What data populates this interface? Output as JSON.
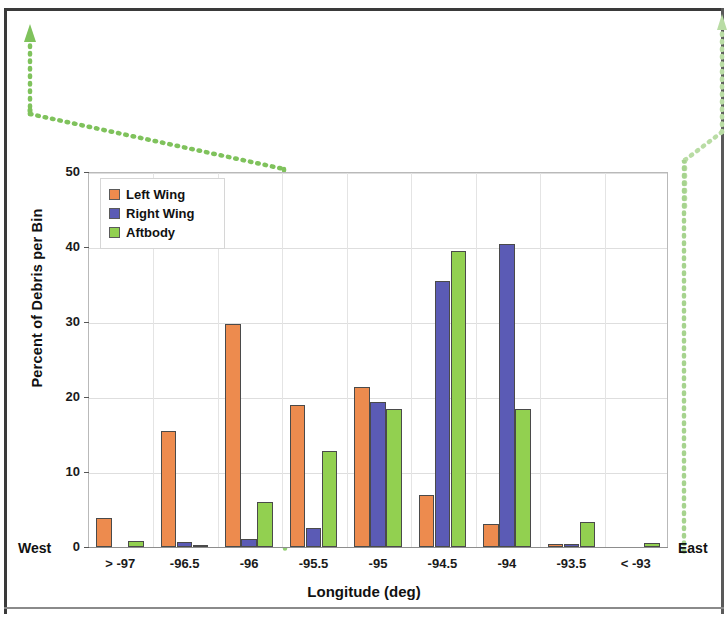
{
  "chart_data": {
    "type": "bar",
    "title": "",
    "xlabel": "Longitude (deg)",
    "ylabel": "Percent of Debris per Bin",
    "categories": [
      "> -97",
      "-96.5",
      "-96",
      "-95.5",
      "-95",
      "-94.5",
      "-94",
      "-93.5",
      "< -93"
    ],
    "series": [
      {
        "name": "Left Wing",
        "color": "#ED8B4E",
        "values": [
          3.9,
          15.5,
          29.8,
          18.9,
          21.3,
          6.9,
          3.1,
          0.4,
          0.0
        ]
      },
      {
        "name": "Right Wing",
        "color": "#5B5BB5",
        "values": [
          0.0,
          0.7,
          1.1,
          2.5,
          19.3,
          35.5,
          40.4,
          0.4,
          0.0
        ]
      },
      {
        "name": "Aftbody",
        "color": "#92D050",
        "values": [
          0.8,
          0.2,
          6.0,
          12.8,
          18.4,
          39.5,
          18.4,
          3.3,
          0.6
        ]
      }
    ],
    "ylim": [
      0,
      50
    ],
    "yticks": [
      0,
      10,
      20,
      30,
      40,
      50
    ],
    "ytick_labels": [
      "0",
      "10",
      "20",
      "30",
      "40",
      "50"
    ],
    "grid": true,
    "legend_position": "top-left"
  },
  "annotations": {
    "west_label": "West",
    "east_label": "East"
  },
  "legend": {
    "items": [
      {
        "label": "Left Wing",
        "color": "#ED8B4E"
      },
      {
        "label": "Right Wing",
        "color": "#5B5BB5"
      },
      {
        "label": "Aftbody",
        "color": "#92D050"
      }
    ]
  },
  "colors": {
    "left_wing": "#ED8B4E",
    "right_wing": "#5B5BB5",
    "aftbody": "#92D050",
    "callout_line": "#7FC25C",
    "grid": "#dedede",
    "axis": "#8d8d8d"
  }
}
